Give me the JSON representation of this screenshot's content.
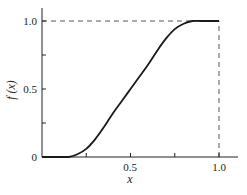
{
  "chart_data": {
    "type": "line",
    "title": "",
    "xlabel": "x",
    "ylabel": "f(x)",
    "xlim": [
      0,
      1.0
    ],
    "ylim": [
      0,
      1.0
    ],
    "grid": false,
    "x_ticks": [
      0,
      0.25,
      0.5,
      0.75,
      1.0
    ],
    "x_tick_labels": [
      "",
      "",
      "0.5",
      "",
      "1.0"
    ],
    "y_ticks": [
      0,
      0.25,
      0.5,
      0.75,
      1.0
    ],
    "y_tick_labels": [
      "0",
      "",
      "0.5",
      "",
      "1.0"
    ],
    "series": [
      {
        "name": "f(x)",
        "style": "solid",
        "x": [
          0,
          0.05,
          0.1,
          0.15,
          0.2,
          0.25,
          0.3,
          0.35,
          0.4,
          0.45,
          0.5,
          0.55,
          0.6,
          0.65,
          0.7,
          0.75,
          0.8,
          0.85,
          0.9,
          0.95,
          1.0
        ],
        "y": [
          0,
          0,
          0,
          0.0,
          0.02,
          0.06,
          0.13,
          0.22,
          0.32,
          0.41,
          0.5,
          0.59,
          0.68,
          0.78,
          0.87,
          0.94,
          0.98,
          1.0,
          1.0,
          1.0,
          1.0
        ]
      }
    ],
    "annotations": [
      {
        "type": "dashed-hline",
        "y": 1.0,
        "x_from": 0,
        "x_to": 1.0
      },
      {
        "type": "dashed-vline",
        "x": 1.0,
        "y_from": 0,
        "y_to": 1.0
      }
    ]
  },
  "labels": {
    "xlabel": "x",
    "ylabel": "f (x)",
    "x_tick_05": "0.5",
    "x_tick_10": "1.0",
    "y_tick_0": "0",
    "y_tick_05": "0.5",
    "y_tick_10": "1.0"
  }
}
